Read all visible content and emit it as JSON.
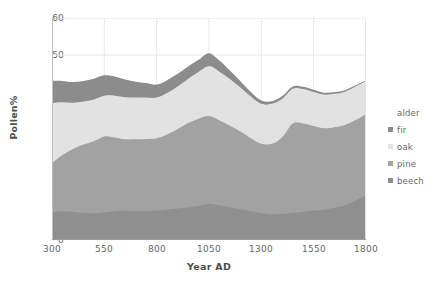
{
  "chart_data": {
    "type": "area",
    "stacked": true,
    "title": "",
    "xlabel": "Year AD",
    "ylabel": "Pollen%",
    "xlim": [
      300,
      1800
    ],
    "ylim": [
      0,
      60
    ],
    "xticks": [
      300,
      550,
      800,
      1050,
      1300,
      1550,
      1800
    ],
    "yticks": [
      0,
      10,
      20,
      30,
      40,
      50,
      60
    ],
    "grid": "faint vertical gridlines at each x tick; horizontal gridline at 50",
    "legend_position": "right",
    "x": [
      300,
      350,
      400,
      450,
      500,
      550,
      600,
      650,
      700,
      750,
      800,
      850,
      900,
      950,
      1000,
      1050,
      1100,
      1150,
      1200,
      1250,
      1300,
      1350,
      1400,
      1450,
      1500,
      1550,
      1600,
      1650,
      1700,
      1750,
      1800
    ],
    "series": [
      {
        "name": "beech",
        "color": "#8f8f8f",
        "values": [
          7.5,
          7.8,
          7.6,
          7.3,
          7.2,
          7.5,
          7.8,
          7.9,
          7.8,
          7.8,
          8.0,
          8.2,
          8.5,
          8.8,
          9.2,
          9.8,
          9.3,
          8.8,
          8.3,
          7.8,
          7.2,
          6.9,
          7.0,
          7.3,
          7.6,
          8.0,
          8.2,
          8.7,
          9.4,
          10.6,
          12.0
        ]
      },
      {
        "name": "pine",
        "color": "#a2a2a2",
        "values": [
          13.3,
          15.2,
          17.0,
          18.5,
          19.5,
          20.5,
          19.9,
          19.3,
          19.4,
          19.5,
          19.5,
          20.3,
          21.5,
          22.8,
          23.6,
          23.7,
          23.0,
          22.1,
          21.0,
          19.7,
          18.8,
          19.1,
          20.8,
          24.2,
          23.9,
          22.8,
          22.0,
          21.8,
          21.7,
          21.8,
          22.0
        ]
      },
      {
        "name": "oak",
        "color": "#e2e2e2",
        "values": [
          16.2,
          14.2,
          12.5,
          11.6,
          11.3,
          11.0,
          11.3,
          11.4,
          11.3,
          11.2,
          11.0,
          11.2,
          11.5,
          12.0,
          12.6,
          13.5,
          13.2,
          12.6,
          11.9,
          11.3,
          10.8,
          10.8,
          10.4,
          9.4,
          9.3,
          9.2,
          9.1,
          9.0,
          9.0,
          9.1,
          9.0
        ]
      },
      {
        "name": "fir",
        "color": "#8c8c8c",
        "values": [
          6.0,
          5.8,
          5.6,
          5.6,
          5.6,
          5.5,
          5.2,
          4.8,
          4.3,
          3.9,
          3.5,
          3.5,
          3.4,
          3.3,
          3.3,
          3.5,
          3.0,
          2.3,
          1.7,
          1.2,
          0.9,
          0.7,
          0.7,
          0.6,
          0.6,
          0.6,
          0.5,
          0.5,
          0.4,
          0.3,
          0.2
        ]
      },
      {
        "name": "alder",
        "color": "#ffffff",
        "values": [
          17.0,
          16.0,
          17.3,
          17.0,
          16.4,
          15.5,
          15.8,
          16.6,
          17.2,
          17.6,
          18.0,
          16.8,
          15.1,
          13.1,
          11.3,
          9.5,
          11.5,
          14.2,
          17.1,
          20.0,
          22.3,
          22.5,
          21.1,
          18.5,
          18.6,
          19.4,
          20.2,
          20.0,
          19.5,
          18.2,
          16.8
        ]
      }
    ],
    "cumulative_tops": {
      "beech": [
        7.5,
        7.8,
        7.6,
        7.3,
        7.2,
        7.5,
        7.8,
        7.9,
        7.8,
        7.8,
        8.0,
        8.2,
        8.5,
        8.8,
        9.2,
        9.8,
        9.3,
        8.8,
        8.3,
        7.8,
        7.2,
        6.9,
        7.0,
        7.3,
        7.6,
        8.0,
        8.2,
        8.7,
        9.4,
        10.6,
        12.0
      ],
      "pine": [
        20.8,
        23.0,
        24.6,
        25.8,
        26.7,
        28.0,
        27.7,
        27.2,
        27.2,
        27.3,
        27.5,
        28.5,
        30.0,
        31.6,
        32.8,
        33.5,
        32.3,
        30.9,
        29.3,
        27.5,
        26.0,
        26.0,
        27.8,
        31.5,
        31.5,
        30.8,
        30.2,
        30.5,
        31.1,
        32.4,
        34.0
      ],
      "oak": [
        37.0,
        37.2,
        37.1,
        37.4,
        38.0,
        39.0,
        39.0,
        38.6,
        38.5,
        38.5,
        38.5,
        39.7,
        41.5,
        43.6,
        45.4,
        47.0,
        45.5,
        43.5,
        41.2,
        38.8,
        36.8,
        36.8,
        38.2,
        40.9,
        40.8,
        40.0,
        39.3,
        39.5,
        40.1,
        41.5,
        43.0
      ],
      "fir": [
        43.0,
        43.0,
        42.7,
        43.0,
        43.6,
        44.5,
        44.2,
        43.4,
        42.8,
        42.4,
        42.0,
        43.2,
        44.9,
        46.9,
        48.7,
        50.5,
        48.5,
        45.8,
        42.9,
        40.0,
        37.7,
        37.5,
        38.9,
        41.5,
        41.4,
        40.6,
        39.8,
        40.0,
        40.5,
        41.8,
        43.2
      ],
      "alder": [
        60,
        60,
        60,
        60,
        60,
        60,
        60,
        60,
        60,
        60,
        60,
        60,
        60,
        60,
        60,
        60,
        60,
        60,
        60,
        60,
        60,
        60,
        60,
        60,
        60,
        60,
        60,
        60,
        60,
        60,
        60
      ]
    }
  },
  "axes": {
    "y_title": "Pollen%",
    "x_title": "Year AD",
    "y_tick_labels": [
      "60",
      "50",
      "40",
      "30",
      "20",
      "10",
      "0"
    ],
    "x_tick_labels": [
      "300",
      "550",
      "800",
      "1050",
      "1300",
      "1550",
      "1800"
    ]
  },
  "legend": {
    "entries": [
      {
        "label": "alder",
        "color": "#ffffff",
        "swatch": false
      },
      {
        "label": "fir",
        "color": "#8c8c8c",
        "swatch": true
      },
      {
        "label": "oak",
        "color": "#e2e2e2",
        "swatch": true
      },
      {
        "label": "pine",
        "color": "#a2a2a2",
        "swatch": true
      },
      {
        "label": "beech",
        "color": "#8f8f8f",
        "swatch": true
      }
    ]
  },
  "style": {
    "background": "#ffffff",
    "gridline_color": "#e8e8e8",
    "text_color": "#666666"
  }
}
